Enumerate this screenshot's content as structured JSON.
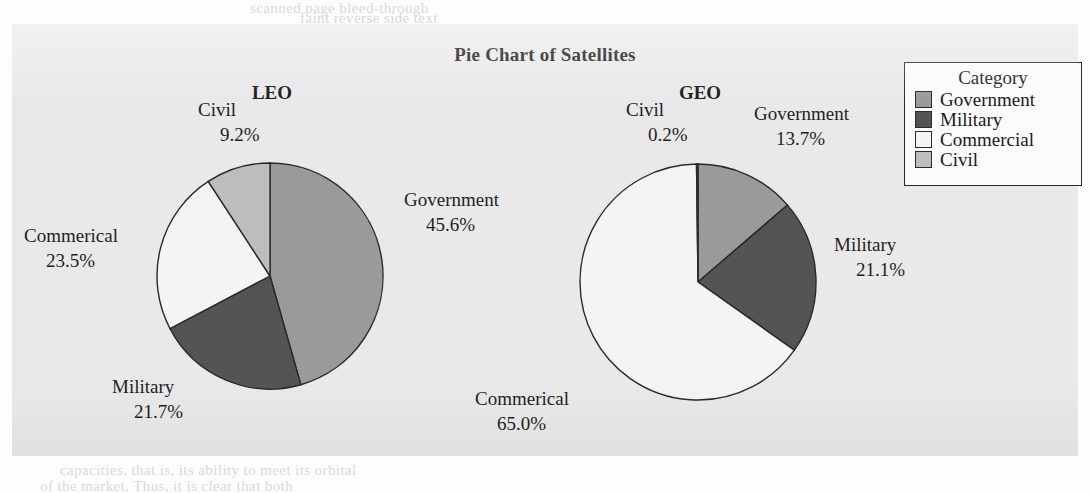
{
  "page": {
    "background": "#e9e9e9",
    "bleed_text": [
      "scanned page bleed-through",
      "faint reverse side text",
      "capacities, that is, its ability to meet its orbital",
      "of the market. Thus, it is clear that both"
    ]
  },
  "chart_data": {
    "type": "pie",
    "title": "Pie Chart of Satellites",
    "legend": {
      "title": "Category",
      "position": "right",
      "entries": [
        {
          "label": "Government",
          "color": "#9a9a9a"
        },
        {
          "label": "Military",
          "color": "#545454"
        },
        {
          "label": "Commercial",
          "color": "#f4f4f4"
        },
        {
          "label": "Civil",
          "color": "#bdbdbd"
        }
      ]
    },
    "categories": [
      "Government",
      "Military",
      "Commerical",
      "Civil"
    ],
    "colors": [
      "#9a9a9a",
      "#545454",
      "#f4f4f4",
      "#bdbdbd"
    ],
    "start_angle": 90,
    "direction": "clockwise",
    "pies": [
      {
        "name": "LEO",
        "values": [
          45.6,
          21.7,
          23.5,
          9.2
        ],
        "labels": [
          {
            "category": "Government",
            "percent": "45.6%"
          },
          {
            "category": "Military",
            "percent": "21.7%"
          },
          {
            "category": "Commerical",
            "percent": "23.5%"
          },
          {
            "category": "Civil",
            "percent": "9.2%"
          }
        ]
      },
      {
        "name": "GEO",
        "values": [
          13.7,
          21.1,
          65.0,
          0.2
        ],
        "labels": [
          {
            "category": "Government",
            "percent": "13.7%"
          },
          {
            "category": "Military",
            "percent": "21.1%"
          },
          {
            "category": "Commerical",
            "percent": "65.0%"
          },
          {
            "category": "Civil",
            "percent": "0.2%"
          }
        ]
      }
    ]
  }
}
